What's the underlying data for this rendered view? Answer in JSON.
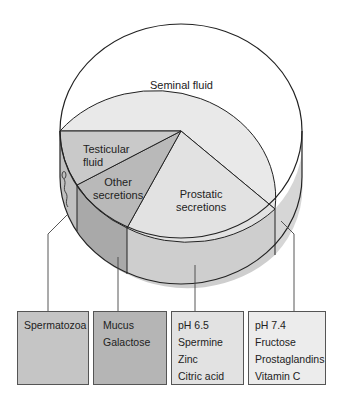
{
  "diagram": {
    "type": "3d-pie-cylinder",
    "segments": [
      {
        "id": "seminal",
        "label": "Seminal fluid",
        "color": "#e9e9e9"
      },
      {
        "id": "prostatic",
        "label_lines": [
          "Prostatic",
          "secretions"
        ],
        "color": "#e2e2e2"
      },
      {
        "id": "other",
        "label_lines": [
          "Other",
          "secretions"
        ],
        "color": "#b9b9b9"
      },
      {
        "id": "testicular",
        "label_lines": [
          "Testicular",
          "fluid"
        ],
        "color": "#c9c9c9"
      }
    ],
    "boxes": [
      {
        "id": "spermatozoa",
        "lines": [
          "Spermatozoa"
        ],
        "color": "#c5c5c5"
      },
      {
        "id": "mucus",
        "lines": [
          "Mucus",
          "Galactose"
        ],
        "color": "#b5b5b5"
      },
      {
        "id": "prostatic-box",
        "lines": [
          "pH 6.5",
          "Spermine",
          "Zinc",
          "Citric acid"
        ],
        "color": "#e2e2e2"
      },
      {
        "id": "seminal-box",
        "lines": [
          "pH 7.4",
          "Fructose",
          "Prostaglandins",
          "Vitamin C"
        ],
        "color": "#ececec"
      }
    ],
    "icons": [
      "sperm-icon"
    ]
  }
}
